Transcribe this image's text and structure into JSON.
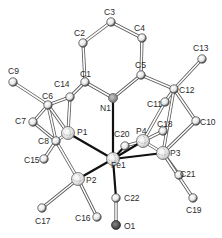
{
  "diagram": {
    "type": "ORTEP molecular structure",
    "atoms": [
      {
        "id": "C1",
        "x": 85,
        "y": 82,
        "lx": 80,
        "ly": 77,
        "kind": "C"
      },
      {
        "id": "C2",
        "x": 83,
        "y": 43,
        "lx": 74,
        "ly": 36,
        "kind": "C"
      },
      {
        "id": "C3",
        "x": 111,
        "y": 22,
        "lx": 104,
        "ly": 15,
        "kind": "C"
      },
      {
        "id": "C4",
        "x": 142,
        "y": 38,
        "lx": 134,
        "ly": 31,
        "kind": "C"
      },
      {
        "id": "C5",
        "x": 141,
        "y": 75,
        "lx": 135,
        "ly": 68,
        "kind": "C"
      },
      {
        "id": "N1",
        "x": 113,
        "y": 98,
        "lx": 100,
        "ly": 111,
        "kind": "N"
      },
      {
        "id": "C6",
        "x": 48,
        "y": 105,
        "lx": 42,
        "ly": 99,
        "kind": "C"
      },
      {
        "id": "C7",
        "x": 33,
        "y": 122,
        "lx": 15,
        "ly": 124,
        "kind": "C"
      },
      {
        "id": "C8",
        "x": 56,
        "y": 141,
        "lx": 38,
        "ly": 144,
        "kind": "C"
      },
      {
        "id": "C9",
        "x": 13,
        "y": 82,
        "lx": 8,
        "ly": 74,
        "kind": "C"
      },
      {
        "id": "C10",
        "x": 196,
        "y": 121,
        "lx": 200,
        "ly": 125,
        "kind": "C"
      },
      {
        "id": "C11",
        "x": 165,
        "y": 102,
        "lx": 147,
        "ly": 107,
        "kind": "C"
      },
      {
        "id": "C12",
        "x": 174,
        "y": 89,
        "lx": 179,
        "ly": 93,
        "kind": "C"
      },
      {
        "id": "C13",
        "x": 202,
        "y": 59,
        "lx": 193,
        "ly": 51,
        "kind": "C"
      },
      {
        "id": "C14",
        "x": 70,
        "y": 97,
        "lx": 54,
        "ly": 87,
        "kind": "C"
      },
      {
        "id": "C15",
        "x": 44,
        "y": 159,
        "lx": 24,
        "ly": 163,
        "kind": "C"
      },
      {
        "id": "C16",
        "x": 97,
        "y": 217,
        "lx": 75,
        "ly": 221,
        "kind": "C"
      },
      {
        "id": "C17",
        "x": 42,
        "y": 208,
        "lx": 35,
        "ly": 224,
        "kind": "C"
      },
      {
        "id": "C18",
        "x": 163,
        "y": 131,
        "lx": 157,
        "ly": 127,
        "kind": "C"
      },
      {
        "id": "C19",
        "x": 193,
        "y": 198,
        "lx": 186,
        "ly": 213,
        "kind": "C"
      },
      {
        "id": "C20",
        "x": 125,
        "y": 146,
        "lx": 114,
        "ly": 137,
        "kind": "C"
      },
      {
        "id": "C21",
        "x": 179,
        "y": 175,
        "lx": 180,
        "ly": 177,
        "kind": "C"
      },
      {
        "id": "C22",
        "x": 116,
        "y": 198,
        "lx": 124,
        "ly": 201,
        "kind": "C"
      },
      {
        "id": "O1",
        "x": 116,
        "y": 225,
        "lx": 124,
        "ly": 229,
        "kind": "O"
      },
      {
        "id": "P1",
        "x": 68,
        "y": 133,
        "lx": 77,
        "ly": 135,
        "kind": "P"
      },
      {
        "id": "P2",
        "x": 78,
        "y": 179,
        "lx": 86,
        "ly": 183,
        "kind": "P"
      },
      {
        "id": "P3",
        "x": 163,
        "y": 153,
        "lx": 170,
        "ly": 156,
        "kind": "P"
      },
      {
        "id": "P4",
        "x": 143,
        "y": 141,
        "lx": 136,
        "ly": 134,
        "kind": "P"
      },
      {
        "id": "Fe1",
        "x": 113,
        "y": 159,
        "lx": 111,
        "ly": 168,
        "kind": "Fe"
      }
    ],
    "metal_bonds": [
      [
        "Fe1",
        "N1"
      ],
      [
        "Fe1",
        "P1"
      ],
      [
        "Fe1",
        "P2"
      ],
      [
        "Fe1",
        "P3"
      ],
      [
        "Fe1",
        "P4"
      ],
      [
        "Fe1",
        "C22"
      ],
      [
        "Fe1",
        "C20"
      ]
    ],
    "bonds": [
      [
        "C1",
        "C2"
      ],
      [
        "C2",
        "C3"
      ],
      [
        "C3",
        "C4"
      ],
      [
        "C4",
        "C5"
      ],
      [
        "C5",
        "N1"
      ],
      [
        "C1",
        "N1"
      ],
      [
        "C1",
        "C14"
      ],
      [
        "C14",
        "C6"
      ],
      [
        "C14",
        "P1"
      ],
      [
        "C6",
        "C9"
      ],
      [
        "C6",
        "C7"
      ],
      [
        "C6",
        "C8"
      ],
      [
        "C7",
        "C8"
      ],
      [
        "C8",
        "P1"
      ],
      [
        "C8",
        "C15"
      ],
      [
        "C8",
        "P2"
      ],
      [
        "C6",
        "P1"
      ],
      [
        "P2",
        "C17"
      ],
      [
        "P2",
        "C16"
      ],
      [
        "C5",
        "C12"
      ],
      [
        "C12",
        "C13"
      ],
      [
        "C12",
        "C11"
      ],
      [
        "C12",
        "C10"
      ],
      [
        "C11",
        "P4"
      ],
      [
        "C10",
        "P3"
      ],
      [
        "C12",
        "P3"
      ],
      [
        "P4",
        "C18"
      ],
      [
        "P4",
        "P3"
      ],
      [
        "P3",
        "C21"
      ],
      [
        "P3",
        "C19"
      ],
      [
        "P4",
        "C20"
      ],
      [
        "C22",
        "O1"
      ]
    ],
    "colors": {
      "bond_outline": "#555555",
      "metal_bond": "#111111",
      "atom_fill": "#ffffff",
      "atom_shade": "#444444",
      "nitrogen_fill": "#9a9a9a",
      "oxygen_fill": "#555555",
      "label": "#2a2a2a"
    }
  }
}
